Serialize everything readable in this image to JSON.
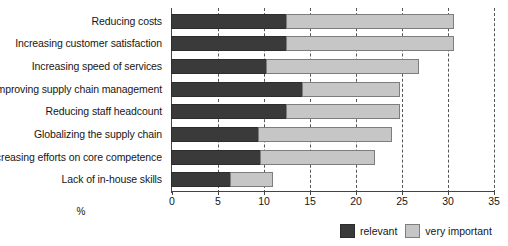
{
  "chart_data": {
    "type": "bar",
    "orientation": "horizontal",
    "stacked": true,
    "title": "",
    "xlabel": "%",
    "ylabel": "",
    "xlim": [
      0,
      35
    ],
    "xticks": [
      0,
      5,
      10,
      15,
      20,
      25,
      30,
      35
    ],
    "xtick_labels": [
      "0",
      "5",
      "10",
      "15",
      "20",
      "25",
      "30",
      "35"
    ],
    "grid": "vertical-dashed",
    "legend_position": "bottom-right",
    "categories": [
      "Reducing costs",
      "Increasing customer satisfaction",
      "Increasing speed of services",
      "Improving supply chain management",
      "Reducing staff headcount",
      "Globalizing the supply chain",
      "Increasing efforts on core competence",
      "Lack of in-house skills"
    ],
    "series": [
      {
        "name": "relevant",
        "color": "#3a3a3a",
        "values": [
          12.6,
          12.6,
          10.4,
          14.3,
          12.6,
          9.6,
          9.8,
          6.5
        ]
      },
      {
        "name": "very important",
        "color": "#c6c6c6",
        "values": [
          18.3,
          18.3,
          16.7,
          10.7,
          12.4,
          14.5,
          12.5,
          4.7
        ]
      }
    ],
    "totals": [
      30.9,
      30.9,
      27.1,
      25.0,
      25.0,
      24.1,
      22.3,
      11.2
    ]
  },
  "legend": {
    "items": [
      {
        "label": "relevant",
        "swatch": "dark"
      },
      {
        "label": "very important",
        "swatch": "light"
      }
    ]
  }
}
